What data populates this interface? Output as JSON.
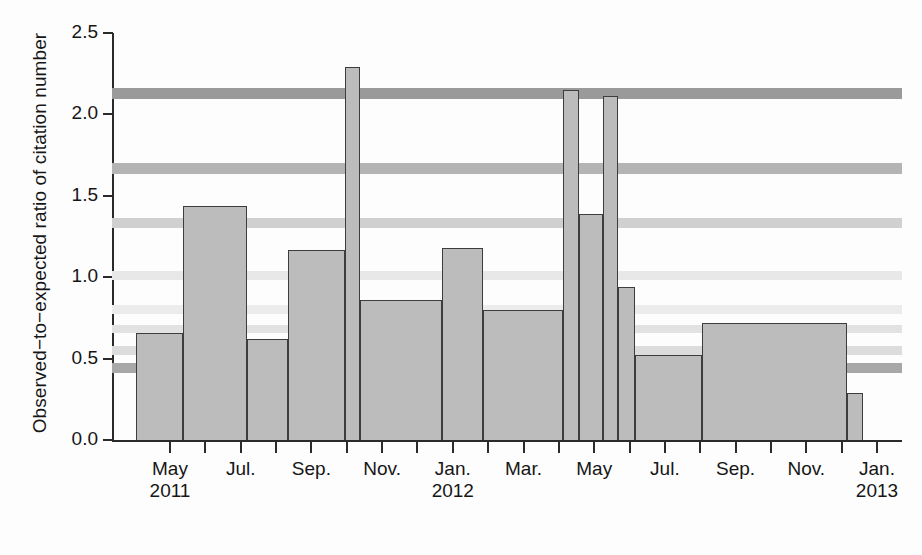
{
  "chart_data": {
    "type": "bar",
    "title": "",
    "xlabel": "",
    "ylabel": "Observed−to−expected ratio of citation number",
    "ylim": [
      0.0,
      2.5
    ],
    "yticks": [
      "0.0",
      "0.5",
      "1.0",
      "1.5",
      "2.0",
      "2.5"
    ],
    "ytick_values": [
      0.0,
      0.5,
      1.0,
      1.5,
      2.0,
      2.5
    ],
    "grid": false,
    "legend": null,
    "xtick_labels": [
      {
        "month": "May",
        "year": "2011"
      },
      {
        "month": "Jul.",
        "year": ""
      },
      {
        "month": "Sep.",
        "year": ""
      },
      {
        "month": "Nov.",
        "year": ""
      },
      {
        "month": "Jan.",
        "year": "2012"
      },
      {
        "month": "Mar.",
        "year": ""
      },
      {
        "month": "May",
        "year": ""
      },
      {
        "month": "Jul.",
        "year": ""
      },
      {
        "month": "Sep.",
        "year": ""
      },
      {
        "month": "Nov.",
        "year": ""
      },
      {
        "month": "Jan.",
        "year": "2013"
      }
    ],
    "categories": [
      "May 2011",
      "Jun–Jul 2011",
      "Aug 2011",
      "Sep–Oct 2011",
      "Oct 2011",
      "Nov–Dec 2011",
      "Jan 2012",
      "Feb–Apr 2012",
      "May 2012",
      "May–Jun 2012",
      "Jun 2012",
      "Jun–Jul 2012",
      "Jul–Aug 2012",
      "Sep–Dec 2012",
      "Jan 2013"
    ],
    "values": [
      0.66,
      1.44,
      0.62,
      1.17,
      2.29,
      0.86,
      1.18,
      0.8,
      2.15,
      1.39,
      2.11,
      0.94,
      0.52,
      0.72,
      0.29
    ],
    "bar_spans_px": [
      [
        136,
        183
      ],
      [
        183,
        247
      ],
      [
        247,
        288
      ],
      [
        288,
        345
      ],
      [
        345,
        360
      ],
      [
        360,
        442
      ],
      [
        442,
        483
      ],
      [
        483,
        563
      ],
      [
        563,
        579
      ],
      [
        579,
        603
      ],
      [
        603,
        618
      ],
      [
        618,
        635
      ],
      [
        635,
        702
      ],
      [
        702,
        847
      ],
      [
        847,
        863
      ]
    ],
    "bar_fill_color": "#bcbcbc",
    "bar_edge_color": "#3d3d3d",
    "scan_artifact_bands": [
      {
        "value": 2.13,
        "shade": "#9a9a9a",
        "thickness": 11
      },
      {
        "value": 1.67,
        "shade": "#b4b4b4",
        "thickness": 11
      },
      {
        "value": 1.33,
        "shade": "#d0d0d0",
        "thickness": 10
      },
      {
        "value": 1.01,
        "shade": "#e8e8e8",
        "thickness": 9
      },
      {
        "value": 0.8,
        "shade": "#ececec",
        "thickness": 9
      },
      {
        "value": 0.68,
        "shade": "#e2e2e2",
        "thickness": 8
      },
      {
        "value": 0.55,
        "shade": "#dcdcdc",
        "thickness": 9
      },
      {
        "value": 0.44,
        "shade": "#a8a8a8",
        "thickness": 10
      }
    ]
  }
}
